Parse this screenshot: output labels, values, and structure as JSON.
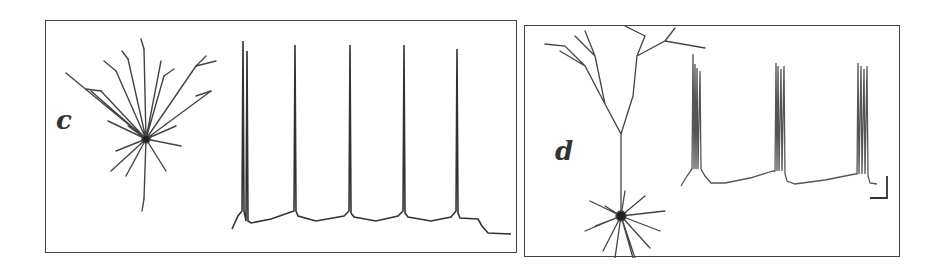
{
  "figure": {
    "panels": [
      {
        "id": "c",
        "label": "c",
        "morphology": "stellate-like neuron with radial dendrites",
        "trace_type": "regular spiking",
        "spike_count": 5
      },
      {
        "id": "d",
        "label": "d",
        "morphology": "pyramidal neuron with apical dendrite and basal dendrites",
        "trace_type": "intrinsic bursting",
        "burst_count": 3,
        "scale_bar": "L-shaped scale bar (unlabeled)"
      }
    ],
    "colors": {
      "ink": "#333333",
      "frame": "#444444",
      "background": "#ffffff"
    }
  }
}
